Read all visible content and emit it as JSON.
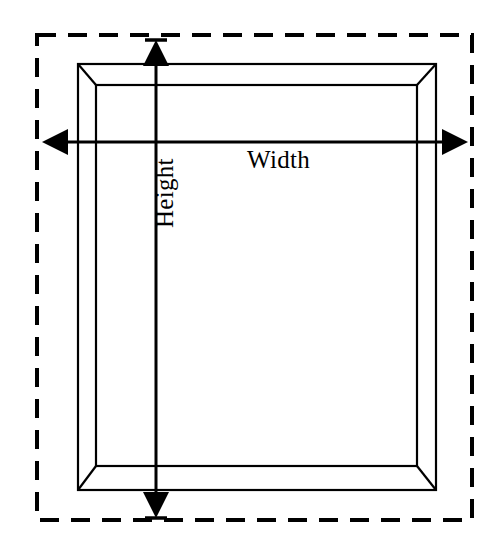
{
  "diagram": {
    "background_color": "#ffffff",
    "stroke_color": "#000000",
    "labels": {
      "width": "Width",
      "height": "Height"
    },
    "bounding_box": {
      "name": "overall-dashed-extent",
      "style": "dashed",
      "x1": 37,
      "y1": 35,
      "x2": 472,
      "y2": 520,
      "dash_length": 19,
      "dash_gap": 12,
      "stroke_width": 4
    },
    "frame_outer": {
      "name": "frame-outer-rectangle",
      "x1": 78,
      "y1": 64,
      "x2": 436,
      "y2": 490,
      "stroke_width": 2.2
    },
    "frame_inner": {
      "name": "frame-inner-rectangle",
      "x1": 96,
      "y1": 85,
      "x2": 417,
      "y2": 466,
      "stroke_width": 2.2
    },
    "bevels": [
      {
        "name": "bevel-top-left",
        "x1": 78,
        "y1": 64,
        "x2": 96,
        "y2": 85
      },
      {
        "name": "bevel-top-right",
        "x1": 436,
        "y1": 64,
        "x2": 417,
        "y2": 85
      },
      {
        "name": "bevel-bottom-left",
        "x1": 78,
        "y1": 490,
        "x2": 96,
        "y2": 466
      },
      {
        "name": "bevel-bottom-right",
        "x1": 436,
        "y1": 490,
        "x2": 417,
        "y2": 466
      }
    ],
    "width_arrow": {
      "name": "width-dimension-arrow",
      "orientation": "horizontal",
      "y": 142,
      "x_start": 42,
      "x_end": 468,
      "stroke_width": 3,
      "arrowhead_length": 26,
      "arrowhead_half_width": 13,
      "double_headed": true
    },
    "height_arrow": {
      "name": "height-dimension-arrow",
      "orientation": "vertical",
      "x": 156,
      "y_start": 40,
      "y_end": 518,
      "stroke_width": 3,
      "arrowhead_length": 26,
      "arrowhead_half_width": 13,
      "double_headed": true,
      "has_end_caps": true,
      "cap_half_width": 11
    }
  }
}
